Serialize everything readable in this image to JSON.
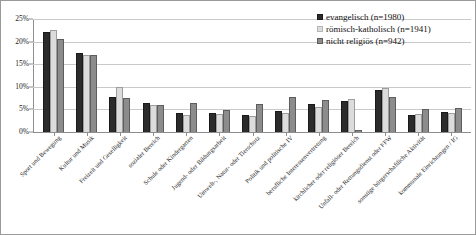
{
  "chart_data": {
    "type": "bar",
    "title": "",
    "xlabel": "",
    "ylabel": "",
    "ylim": [
      0,
      25
    ],
    "ytick_labels": [
      "25%",
      "20%",
      "15%",
      "10%",
      "5%",
      "0%"
    ],
    "ytick_values": [
      25,
      20,
      15,
      10,
      5,
      0
    ],
    "grid": true,
    "legend_position": "top-right",
    "categories": [
      "Sport und Bewegung",
      "Kultur und Musik",
      "Freizeit und Geselligkeit",
      "sozialer Bereich",
      "Schule oder Kindergarten",
      "Jugend- oder Bildungsarbeit",
      "Umwelt-, Natur- oder Tierschutz",
      "Politik und politische IV",
      "berufliche Interessenvertretung",
      "kirchlicher oder religiöser Bereich",
      "Unfall- oder Rettungsdienst oder FFW",
      "sonstige bürgerschaftliche Aktivität",
      "kommunale Einrichtungen / IG"
    ],
    "series": [
      {
        "name": "evangelisch (n=1980)",
        "color": "#2b2b2b",
        "values": [
          22.2,
          17.4,
          7.8,
          6.5,
          4.3,
          4.3,
          3.7,
          4.6,
          6.2,
          6.9,
          9.3,
          3.8,
          4.5
        ]
      },
      {
        "name": "römisch-katholisch (n=1941)",
        "color": "#dcdcdc",
        "values": [
          22.5,
          17.0,
          10.0,
          5.9,
          3.8,
          3.9,
          3.5,
          4.2,
          5.5,
          7.3,
          9.7,
          3.9,
          4.2
        ]
      },
      {
        "name": "nicht religiös (n=942)",
        "color": "#8c8c8c",
        "values": [
          20.6,
          17.1,
          7.5,
          6.0,
          6.4,
          4.8,
          6.1,
          7.8,
          7.0,
          0.5,
          7.7,
          5.0,
          5.4
        ]
      }
    ]
  },
  "legend": {
    "items": [
      {
        "label": "evangelisch (n=1980)"
      },
      {
        "label": "römisch-katholisch (n=1941)"
      },
      {
        "label": "nicht religiös (n=942)"
      }
    ]
  }
}
